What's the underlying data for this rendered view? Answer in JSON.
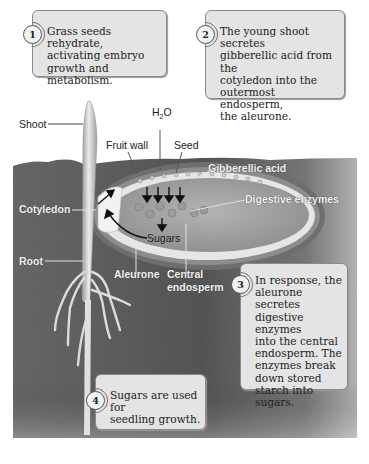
{
  "steps": [
    {
      "number": "1",
      "text_lines": [
        "Grass seeds rehydrate,",
        "activating embryo",
        "growth and metabolism."
      ]
    },
    {
      "number": "2",
      "text_lines": [
        "The young shoot secretes",
        "gibberellic acid from the",
        "cotyledon into the",
        "outermost endosperm,",
        "the aleurone."
      ]
    },
    {
      "number": "3",
      "text_lines": [
        "In response, the",
        "aleurone secretes",
        "digestive enzymes",
        "into the central",
        "endosperm. The",
        "enzymes break",
        "down stored",
        "starch into sugars."
      ]
    },
    {
      "number": "4",
      "text_lines": [
        "Sugars are used for",
        "seedling growth."
      ]
    }
  ],
  "labels": {
    "shoot": "Shoot",
    "h2o_main": "H",
    "h2o_sub": "2",
    "h2o_end": "O",
    "fruit_wall": "Fruit wall",
    "seed": "Seed",
    "gibberellic_acid": "Gibberellic acid",
    "digestive_enzymes": "Digestive enzymes",
    "cotyledon": "Cotyledon",
    "sugars": "Sugars",
    "root": "Root",
    "aleurone": "Aleurone",
    "central_endosperm_1": "Central",
    "central_endosperm_2": "endosperm"
  },
  "colors": {
    "soil": "#5e5e5e",
    "box_fill": "#e4e4e4",
    "box_border": "#8a8a8a",
    "seed_inner": "#a8a8a8",
    "aleurone": "#e8e8e8"
  }
}
